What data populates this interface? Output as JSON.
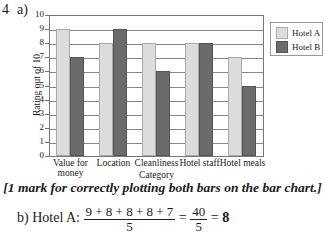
{
  "question": {
    "number": "4",
    "part_a": "a)",
    "note": "[1 mark for correctly plotting both bars on the bar chart.]",
    "part_b": {
      "label": "b) Hotel A:",
      "numerator": "9 + 8 + 8 + 8 + 7",
      "denominator": "5",
      "equals1": "=",
      "numerator2": "40",
      "denominator2": "5",
      "equals2": "=",
      "result": "8"
    }
  },
  "chart_data": {
    "type": "bar",
    "title": "",
    "xlabel": "Category",
    "ylabel": "Rating out of 10",
    "ylim": [
      0,
      10
    ],
    "yticks": [
      "0",
      "1",
      "2",
      "3",
      "4",
      "5",
      "6",
      "7",
      "8",
      "9",
      "10"
    ],
    "grid": true,
    "legend_position": "right",
    "categories": [
      "Value for money",
      "Location",
      "Cleanliness",
      "Hotel staff",
      "Hotel meals"
    ],
    "category_labels": [
      [
        "Value for",
        "money"
      ],
      [
        "Location"
      ],
      [
        "Cleanliness"
      ],
      [
        "Hotel staff"
      ],
      [
        "Hotel meals"
      ]
    ],
    "series": [
      {
        "name": "Hotel A",
        "values": [
          9,
          8,
          8,
          8,
          7
        ],
        "color": "#dcdcdc"
      },
      {
        "name": "Hotel B",
        "values": [
          7,
          9,
          6,
          8,
          5
        ],
        "color": "#6b6b6b"
      }
    ]
  }
}
